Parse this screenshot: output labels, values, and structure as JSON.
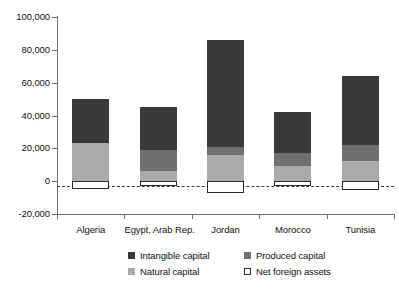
{
  "chart_data": {
    "type": "bar",
    "subtype": "stacked-bar",
    "title": "",
    "xlabel": "",
    "ylabel": "",
    "categories": [
      "Algeria",
      "Egypt, Arab Rep.",
      "Jordan",
      "Morocco",
      "Tunisia"
    ],
    "series": [
      {
        "name": "Natural capital",
        "color": "#aaaaaa",
        "values": [
          23000,
          6000,
          16000,
          9000,
          12000
        ]
      },
      {
        "name": "Produced capital",
        "color": "#707070",
        "values": [
          0,
          13000,
          5000,
          8000,
          10000
        ]
      },
      {
        "name": "Intangible capital",
        "color": "#3a3a3a",
        "values": [
          27000,
          26000,
          65000,
          25000,
          42000
        ]
      },
      {
        "name": "Net foreign assets",
        "color": "#ffffff",
        "values": [
          -11500,
          -1500,
          -7500,
          -1200,
          -5500
        ]
      }
    ],
    "totals": [
      50000,
      45000,
      86000,
      42000,
      64000
    ],
    "ylim": [
      -20000,
      100000
    ],
    "ytick_values": [
      100000,
      80000,
      60000,
      40000,
      20000,
      0,
      -20000
    ],
    "ytick_labels": [
      "100,000",
      "80,000",
      "60,000",
      "40,000",
      "20,000",
      "0",
      "-20,000"
    ],
    "grid": false,
    "zero_line": true,
    "legend_position": "bottom-right",
    "legend": [
      {
        "label": "Intangible capital",
        "color": "#3a3a3a",
        "swatch": "filled"
      },
      {
        "label": "Produced capital",
        "color": "#707070",
        "swatch": "filled"
      },
      {
        "label": "Natural capital",
        "color": "#aaaaaa",
        "swatch": "filled"
      },
      {
        "label": "Net foreign assets",
        "color": "#ffffff",
        "swatch": "outline"
      }
    ]
  },
  "axis": {
    "y_labels": [
      "100,000",
      "80,000",
      "60,000",
      "40,000",
      "20,000",
      "0",
      "-20,000"
    ],
    "x_labels": [
      "Algeria",
      "Egypt, Arab Rep.",
      "Jordan",
      "Morocco",
      "Tunisia"
    ]
  },
  "legend": {
    "row1_col1": "Intangible capital",
    "row1_col2": "Produced capital",
    "row2_col1": "Natural capital",
    "row2_col2": "Net foreign assets"
  },
  "colors": {
    "intangible": "#3a3a3a",
    "produced": "#707070",
    "natural": "#aaaaaa",
    "net_foreign_assets": "#ffffff",
    "axis": "#6d6d6d",
    "text": "#121212"
  }
}
